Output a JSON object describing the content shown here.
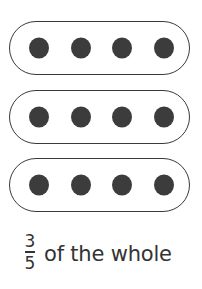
{
  "figure": {
    "groups": [
      {
        "dots": 4,
        "top": 21
      },
      {
        "dots": 4,
        "top": 90
      },
      {
        "dots": 4,
        "top": 158
      }
    ],
    "dot_x": [
      29,
      54,
      79,
      105
    ],
    "colors": {
      "dot": "#3c3c3c",
      "outline": "#3a3a3a",
      "text": "#333333"
    }
  },
  "caption": {
    "numerator": "3",
    "denominator": "5",
    "text": "of the whole"
  }
}
